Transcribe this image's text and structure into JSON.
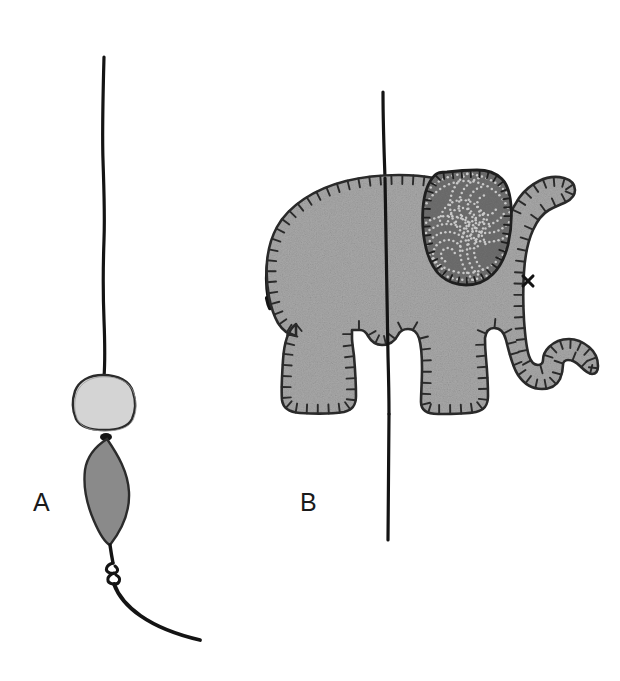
{
  "figure": {
    "background_color": "#ffffff",
    "width": 620,
    "height": 681,
    "panels": [
      {
        "id": "A",
        "label": "A",
        "label_position": {
          "x": 33,
          "y": 490
        },
        "description": "Vertical hanging thread with a round light bead, an elongated dark bead, a knot and a curving thread tail",
        "elements": [
          {
            "name": "hanging-thread-upper",
            "type": "thread",
            "color": "#141414",
            "stroke_width": 3.2,
            "path": "M 104,57 L 103,150 L 105,250 L 103,320 L 105,378"
          },
          {
            "name": "bead-round-light",
            "type": "bead",
            "shape": "rounded-circle",
            "fill": "#d4d4d4",
            "stroke": "#2b2b2b",
            "stroke_width": 2.2,
            "center": {
              "x": 103,
              "y": 402
            },
            "radius_x": 30,
            "radius_y": 27
          },
          {
            "name": "bead-oval-dark",
            "type": "bead",
            "shape": "lens-ellipse",
            "fill": "#8a8a8a",
            "stroke": "#2b2b2b",
            "stroke_width": 2.2,
            "center": {
              "x": 106,
              "y": 492
            },
            "radius_x": 23,
            "radius_y": 53
          },
          {
            "name": "thread-knot",
            "type": "knot",
            "color": "#141414",
            "center": {
              "x": 113,
              "y": 572
            }
          },
          {
            "name": "hanging-thread-tail",
            "type": "thread",
            "color": "#141414",
            "stroke_width": 3.6,
            "path": "M 113,580 C 123,604 150,627 200,639"
          }
        ]
      },
      {
        "id": "B",
        "label": "B",
        "label_position": {
          "x": 300,
          "y": 490
        },
        "description": "Grey felt elephant plush threaded on a vertical string, blanket-stitch edging, patterned darker ear, cross-stitch eye, thin curled tail",
        "elements": [
          {
            "name": "hanging-thread-through-elephant",
            "type": "thread",
            "color": "#141414",
            "stroke_width": 3.2,
            "path": "M 383,92 L 385,200 L 388,320 L 390,430 L 388,540"
          },
          {
            "name": "elephant-body",
            "type": "felt-shape",
            "fill": "#a9a9a9",
            "stroke": "#2a2a2a",
            "stroke_width": 2.6,
            "texture": "mottled-felt"
          },
          {
            "name": "blanket-stitch-edging",
            "type": "stitching",
            "color": "#2a2a2a",
            "stitch_length": 9,
            "stitch_spacing": 11
          },
          {
            "name": "elephant-ear",
            "type": "felt-shape",
            "fill": "#6e6e6e",
            "stroke": "#1f1f1f",
            "stroke_width": 2.6,
            "pattern": "dotted-paisley-spirals",
            "pattern_dot_color": "#c9c9c9"
          },
          {
            "name": "elephant-eye",
            "type": "cross-stitch",
            "glyph": "x",
            "color": "#141414",
            "position": {
              "x": 528,
              "y": 281
            }
          },
          {
            "name": "elephant-tail",
            "type": "thread",
            "color": "#141414",
            "stroke_width": 2.6,
            "path": "M 279,224 C 266,245 262,275 268,303"
          },
          {
            "name": "elephant-trunk",
            "type": "felt-shape",
            "note": "curls upward at the tip"
          },
          {
            "name": "elephant-legs",
            "type": "felt-shape",
            "count": 2,
            "note": "front and rear legs with rounded feet"
          }
        ]
      }
    ]
  },
  "colors": {
    "background": "#ffffff",
    "ink": "#141414",
    "felt_body": "#a9a9a9",
    "felt_ear": "#6e6e6e",
    "bead_light": "#d4d4d4",
    "bead_dark": "#8a8a8a",
    "stitch": "#2a2a2a"
  }
}
